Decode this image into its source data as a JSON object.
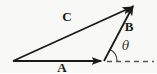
{
  "figure": {
    "type": "vector-diagram",
    "labels": {
      "vector_a": "A",
      "vector_b": "B",
      "vector_c": "C",
      "angle": "θ"
    },
    "colors": {
      "stroke": "#1a1a1a",
      "dashed": "#555555",
      "arc": "#333333",
      "background": "#f8f8f6"
    }
  }
}
